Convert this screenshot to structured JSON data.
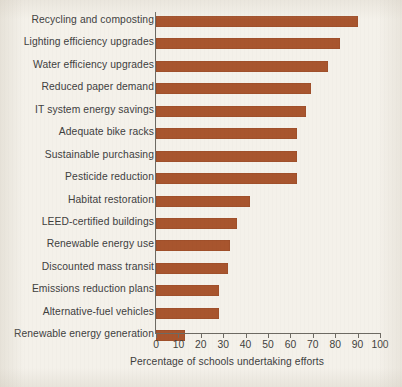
{
  "chart_data": {
    "type": "bar",
    "orientation": "horizontal",
    "title": "",
    "subtitle": "",
    "xlabel": "Percentage of schools undertaking efforts",
    "ylabel": "",
    "xlim": [
      0,
      100
    ],
    "xticks": [
      0,
      10,
      20,
      30,
      40,
      50,
      60,
      70,
      80,
      90,
      100
    ],
    "xtick_labels": [
      "0",
      "10",
      "20",
      "30",
      "40",
      "50",
      "60",
      "70",
      "80",
      "90",
      "100"
    ],
    "grid": false,
    "legend": null,
    "bar_color": "#a8552e",
    "background_color": "#f4f1ea",
    "axis_color": "#6d6a63",
    "categories": [
      "Recycling and composting",
      "Lighting efficiency upgrades",
      "Water efficiency upgrades",
      "Reduced paper demand",
      "IT system energy savings",
      "Adequate bike racks",
      "Sustainable purchasing",
      "Pesticide reduction",
      "Habitat restoration",
      "LEED-certified buildings",
      "Renewable energy use",
      "Discounted mass transit",
      "Emissions reduction plans",
      "Alternative-fuel vehicles",
      "Renewable energy generation"
    ],
    "values": [
      90,
      82,
      77,
      69,
      67,
      63,
      63,
      63,
      42,
      36,
      33,
      32,
      28,
      28,
      13
    ],
    "series": [
      {
        "name": "Percentage of schools undertaking efforts",
        "values": [
          90,
          82,
          77,
          69,
          67,
          63,
          63,
          63,
          42,
          36,
          33,
          32,
          28,
          28,
          13
        ]
      }
    ]
  }
}
